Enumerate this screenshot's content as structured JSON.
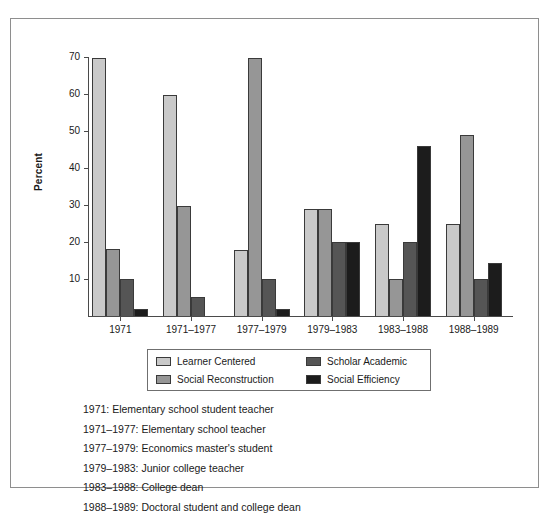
{
  "top_cut_text": "",
  "chart_data": {
    "type": "bar",
    "title": "",
    "xlabel": "",
    "ylabel": "Percent",
    "ylim": [
      0,
      70
    ],
    "yticks": [
      10,
      20,
      30,
      40,
      50,
      60,
      70
    ],
    "grid": false,
    "legend_position": "bottom",
    "categories": [
      "1971",
      "1971–1977",
      "1977–1979",
      "1979–1983",
      "1983–1988",
      "1988–1989"
    ],
    "series": [
      {
        "name": "Learner Centered",
        "color": "#c9c9c9",
        "values": [
          69.8,
          59.6,
          17.8,
          28.8,
          25.0,
          25.0
        ]
      },
      {
        "name": "Social Reconstruction",
        "color": "#969696",
        "values": [
          18.0,
          29.8,
          69.6,
          28.8,
          10.0,
          48.8
        ]
      },
      {
        "name": "Scholar Academic",
        "color": "#555555",
        "values": [
          10.0,
          5.2,
          10.0,
          20.0,
          20.0,
          10.0
        ]
      },
      {
        "name": "Social Efficiency",
        "color": "#1c1c1c",
        "values": [
          2.0,
          0.0,
          2.0,
          20.0,
          46.0,
          14.4
        ]
      }
    ]
  },
  "notes": [
    "1971: Elementary school student teacher",
    "1971–1977: Elementary school teacher",
    "1977–1979: Economics master's student",
    "1979–1983: Junior college teacher",
    "1983–1988: College dean",
    "1988–1989: Doctoral student and college dean"
  ]
}
